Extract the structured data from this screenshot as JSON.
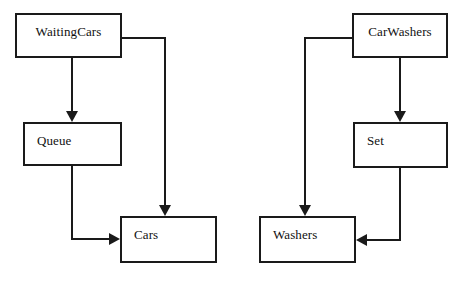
{
  "diagram": {
    "background_color": "#ffffff",
    "line_color": "#1a1a1a",
    "text_color": "#111111",
    "width": 472,
    "height": 287,
    "nodes": [
      {
        "id": "waitingcars",
        "label": "WaitingCars",
        "x": 15,
        "y": 13,
        "w": 107,
        "h": 45,
        "align": "center"
      },
      {
        "id": "queue",
        "label": "Queue",
        "x": 23,
        "y": 122,
        "w": 99,
        "h": 44,
        "align": "left"
      },
      {
        "id": "cars",
        "label": "Cars",
        "x": 120,
        "y": 216,
        "w": 97,
        "h": 47,
        "align": "left"
      },
      {
        "id": "carwashers",
        "label": "CarWashers",
        "x": 352,
        "y": 13,
        "w": 96,
        "h": 45,
        "align": "center"
      },
      {
        "id": "set",
        "label": "Set",
        "x": 353,
        "y": 122,
        "w": 95,
        "h": 46,
        "align": "left"
      },
      {
        "id": "washers",
        "label": "Washers",
        "x": 259,
        "y": 216,
        "w": 97,
        "h": 47,
        "align": "left"
      }
    ],
    "edges": [
      {
        "id": "waitingcars-to-queue",
        "from": "waitingcars",
        "to": "queue",
        "points": "72,58 72,118",
        "arrow": "down",
        "arrow_x": 72,
        "arrow_y": 122
      },
      {
        "id": "waitingcars-to-cars",
        "from": "waitingcars",
        "to": "cars",
        "points": "122,38 165,38 165,212",
        "arrow": "down",
        "arrow_x": 165,
        "arrow_y": 216
      },
      {
        "id": "queue-to-cars",
        "from": "queue",
        "to": "cars",
        "points": "72,166 72,239 114,239",
        "arrow": "right",
        "arrow_x": 120,
        "arrow_y": 239
      },
      {
        "id": "carwashers-to-set",
        "from": "carwashers",
        "to": "set",
        "points": "400,58 400,118",
        "arrow": "down",
        "arrow_x": 400,
        "arrow_y": 122
      },
      {
        "id": "carwashers-to-washers",
        "from": "carwashers",
        "to": "washers",
        "points": "352,38 305,38 305,212",
        "arrow": "down",
        "arrow_x": 305,
        "arrow_y": 216
      },
      {
        "id": "set-to-washers",
        "from": "set",
        "to": "washers",
        "points": "400,168 400,240 362,240",
        "arrow": "left",
        "arrow_x": 356,
        "arrow_y": 240
      }
    ]
  }
}
